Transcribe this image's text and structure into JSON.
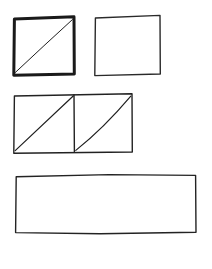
{
  "document": {
    "title": "Hand-drawn geometry sketch",
    "background_color": "#ffffff",
    "ink_color": "#1a1a1a",
    "width": 212,
    "height": 269
  },
  "chart_data": {
    "type": "diagram",
    "shapes": [
      {
        "id": "square-diagonal-bold",
        "label": "Bold square with diagonal",
        "kind": "square",
        "row": 1,
        "column": 1,
        "x": 14,
        "y": 18,
        "width": 60,
        "height": 56,
        "stroke_width": 3,
        "filled": false,
        "diagonals": 1,
        "diagonal_direction": "bottom-left-to-top-right",
        "diagonal_stroke_width": 1
      },
      {
        "id": "square-plain",
        "label": "Plain square",
        "kind": "square",
        "row": 1,
        "column": 2,
        "x": 95,
        "y": 17,
        "width": 65,
        "height": 57,
        "stroke_width": 1.4,
        "filled": false,
        "diagonals": 0,
        "diagonal_direction": "none"
      },
      {
        "id": "rect-two-cells-diagonals",
        "label": "Two-cell rectangle with diagonals",
        "kind": "rectangle",
        "row": 2,
        "column": 1,
        "x": 14,
        "y": 95,
        "width": 118,
        "height": 57,
        "stroke_width": 1.4,
        "filled": false,
        "cells": 2,
        "divider_x": 74,
        "diagonals": 2,
        "diagonal_direction": "bottom-left-to-top-right",
        "diagonal_stroke_width": 1.2,
        "second_diagonal_curved": true
      },
      {
        "id": "rect-wide-plain",
        "label": "Wide plain rectangle",
        "kind": "rectangle",
        "row": 3,
        "column": 1,
        "x": 15,
        "y": 175,
        "width": 181,
        "height": 58,
        "stroke_width": 1.4,
        "filled": false,
        "diagonals": 0,
        "diagonal_direction": "none"
      }
    ],
    "counts": {
      "total_shapes": 4,
      "squares": 3,
      "rectangles": 2,
      "shapes_with_diagonals": 3
    },
    "annotations": [],
    "legend": [],
    "grid": false
  }
}
